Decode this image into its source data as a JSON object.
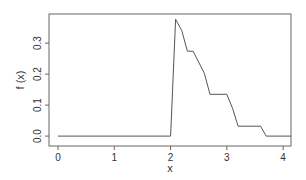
{
  "chart_data": {
    "type": "line",
    "title": "",
    "xlabel": "x",
    "ylabel": "f (x)",
    "xlim": [
      -0.16,
      4.14
    ],
    "ylim": [
      -0.032,
      0.394
    ],
    "grid": false,
    "legend": null,
    "x_ticks": [
      0,
      1,
      2,
      3,
      4
    ],
    "x_tick_labels": [
      "0",
      "1",
      "2",
      "3",
      "4"
    ],
    "y_ticks": [
      0.0,
      0.1,
      0.2,
      0.3
    ],
    "y_tick_labels": [
      "0.0",
      "0.1",
      "0.2",
      "0.3"
    ],
    "series": [
      {
        "name": "f(x)",
        "color": "#555555",
        "x": [
          0.0,
          2.0,
          2.09,
          2.2,
          2.3,
          2.4,
          2.6,
          2.7,
          3.0,
          3.1,
          3.2,
          3.6,
          3.7,
          4.14
        ],
        "y": [
          0.0,
          0.0,
          0.377,
          0.34,
          0.274,
          0.274,
          0.203,
          0.135,
          0.135,
          0.09,
          0.032,
          0.032,
          0.0,
          0.0
        ]
      }
    ]
  },
  "labels": {
    "xlabel": "x",
    "ylabel": "f (x)"
  }
}
